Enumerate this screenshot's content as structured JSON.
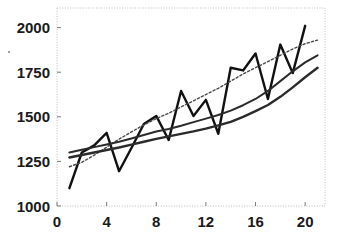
{
  "chart_data": {
    "type": "line",
    "title": "",
    "xlabel": "",
    "ylabel": "",
    "xlim": [
      0,
      21.6
    ],
    "ylim": [
      1000,
      2110
    ],
    "grid": false,
    "legend": "none",
    "xticks": [
      0,
      4,
      8,
      12,
      16,
      20
    ],
    "xtick_labels": [
      "0",
      "4",
      "8",
      "12",
      "16",
      "20"
    ],
    "yticks": [
      1000,
      1250,
      1500,
      1750,
      2000
    ],
    "ytick_labels": [
      "1000",
      "1250",
      "1500",
      "1750",
      "2000"
    ],
    "x": [
      1,
      2,
      3,
      4,
      5,
      6,
      7,
      8,
      9,
      10,
      11,
      12,
      13,
      14,
      15,
      16,
      17,
      18,
      19,
      20,
      21
    ],
    "series": [
      {
        "name": "observed",
        "style": "solid",
        "color": "#111111",
        "width": 2.4,
        "values": [
          1100,
          1300,
          1340,
          1410,
          1195,
          1325,
          1460,
          1505,
          1370,
          1645,
          1505,
          1595,
          1405,
          1775,
          1760,
          1855,
          1600,
          1905,
          1745,
          2010,
          null
        ]
      },
      {
        "name": "dotted-trend",
        "style": "dotted",
        "color": "#4a4a4a",
        "width": 1.4,
        "values": [
          1220,
          1245,
          1285,
          1330,
          1375,
          1415,
          1455,
          1490,
          1520,
          1555,
          1590,
          1625,
          1660,
          1700,
          1740,
          1775,
          1810,
          1845,
          1880,
          1910,
          1930
        ]
      },
      {
        "name": "upper-smooth-trend",
        "style": "solid",
        "color": "#2b2b2b",
        "width": 2.0,
        "values": [
          1300,
          1315,
          1330,
          1345,
          1360,
          1378,
          1398,
          1418,
          1432,
          1450,
          1470,
          1490,
          1510,
          1535,
          1565,
          1600,
          1645,
          1700,
          1755,
          1805,
          1845
        ]
      },
      {
        "name": "lower-smooth-trend",
        "style": "solid",
        "color": "#2b2b2b",
        "width": 2.4,
        "values": [
          1272,
          1286,
          1300,
          1314,
          1328,
          1344,
          1360,
          1376,
          1390,
          1404,
          1418,
          1434,
          1452,
          1472,
          1500,
          1532,
          1566,
          1612,
          1665,
          1722,
          1775
        ]
      }
    ]
  },
  "plot_frame": {
    "left": 57,
    "top": 8,
    "right": 325,
    "bottom": 206
  },
  "colors": {
    "background": "#ffffff",
    "frame": "#bdbdbd",
    "text": "#1a1a1a"
  }
}
